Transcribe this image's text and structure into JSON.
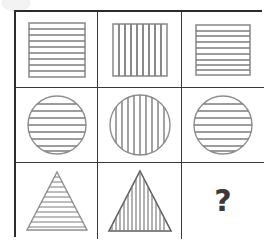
{
  "puzzle": {
    "type": "matrix-reasoning",
    "title": "Figure Matrix Puzzle",
    "rows": 3,
    "columns": 3,
    "outer_border_color": "#2b2b2b",
    "grid_line_color": "#3a3a3a",
    "figure_stroke_color": "#8a8a8a",
    "figure_outline_color": "#6e6e6e",
    "background_color": "#ffffff",
    "question_mark_color": "#3a3a3a",
    "cells": [
      {
        "index": 1,
        "row": 1,
        "column": 1,
        "shape": "square",
        "hatching": "horizontal",
        "line_count": 8,
        "label": "",
        "is_answer_slot": false
      },
      {
        "index": 2,
        "row": 1,
        "column": 2,
        "shape": "square",
        "hatching": "vertical",
        "line_count": 8,
        "label": "",
        "is_answer_slot": false
      },
      {
        "index": 3,
        "row": 1,
        "column": 3,
        "shape": "square",
        "hatching": "horizontal",
        "line_count": 8,
        "label": "",
        "is_answer_slot": false
      },
      {
        "index": 4,
        "row": 2,
        "column": 1,
        "shape": "circle",
        "hatching": "horizontal",
        "line_count": 8,
        "label": "",
        "is_answer_slot": false
      },
      {
        "index": 5,
        "row": 2,
        "column": 2,
        "shape": "circle",
        "hatching": "vertical",
        "line_count": 9,
        "label": "",
        "is_answer_slot": false
      },
      {
        "index": 6,
        "row": 2,
        "column": 3,
        "shape": "circle",
        "hatching": "horizontal",
        "line_count": 8,
        "label": "",
        "is_answer_slot": false
      },
      {
        "index": 7,
        "row": 3,
        "column": 1,
        "shape": "triangle",
        "hatching": "horizontal",
        "line_count": 11,
        "label": "",
        "is_answer_slot": false
      },
      {
        "index": 8,
        "row": 3,
        "column": 2,
        "shape": "triangle",
        "hatching": "vertical",
        "line_count": 14,
        "label": "",
        "is_answer_slot": false
      },
      {
        "index": 9,
        "row": 3,
        "column": 3,
        "shape": "none",
        "hatching": "none",
        "line_count": 0,
        "label": "?",
        "is_answer_slot": true
      }
    ]
  }
}
